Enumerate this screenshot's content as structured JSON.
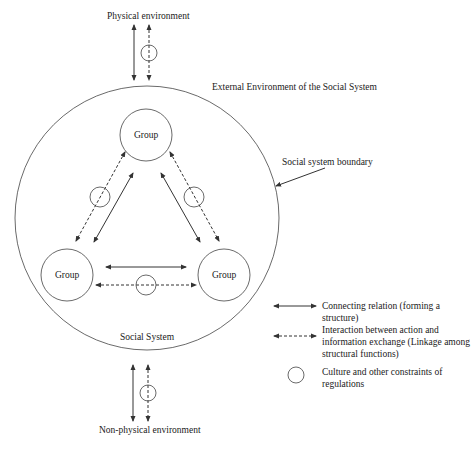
{
  "labels": {
    "physical_environment": "Physical environment",
    "external_environment": "External Environment of the Social System",
    "boundary": "Social system boundary",
    "social_system": "Social System",
    "non_physical_environment": "Non-physical environment"
  },
  "groups": [
    {
      "id": "top",
      "label": "Group"
    },
    {
      "id": "left",
      "label": "Group"
    },
    {
      "id": "right",
      "label": "Group"
    }
  ],
  "legend": [
    {
      "symbol": "solid-double-arrow",
      "text": "Connecting relation (forming a structure)"
    },
    {
      "symbol": "dashed-double-arrow",
      "text": "Interaction between action and information exchange (Linkage among structural functions)"
    },
    {
      "symbol": "circle",
      "text": "Culture and other constraints of regulations"
    }
  ],
  "colors": {
    "line": "#333333",
    "text": "#1a1a1a",
    "background": "#ffffff"
  }
}
